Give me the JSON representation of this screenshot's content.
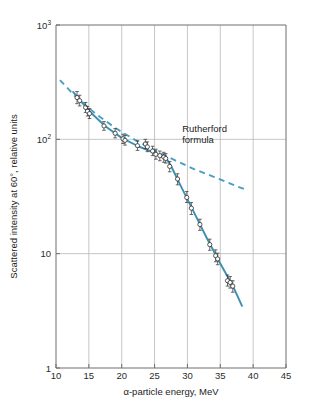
{
  "figure": {
    "background": "#ffffff",
    "curve_color": "#3d8fb0",
    "rutherford_color": "#4b9ec2",
    "grid_color": "#b8b8b8",
    "axis_color": "#6e6e6e",
    "marker_face": "#ffffff",
    "marker_edge": "#2f2f2f"
  },
  "chart_data": {
    "type": "scatter",
    "title": "",
    "xlabel": "α-particle energy, MeV",
    "ylabel": "Scattered intensity at 60°, relative units",
    "xlim": [
      10,
      45
    ],
    "ylim": [
      1,
      1000
    ],
    "yscale": "log",
    "xscale": "linear",
    "grid": true,
    "legend": "none",
    "xticks": [
      10,
      15,
      20,
      25,
      30,
      35,
      40,
      45
    ],
    "xticklabels": [
      "10",
      "15",
      "20",
      "25",
      "30",
      "35",
      "40",
      "45"
    ],
    "yticks": [
      1,
      10,
      100,
      1000
    ],
    "yticklabels": [
      "1",
      "10",
      "10²",
      "10³"
    ],
    "annotations": [
      {
        "text_line1": "Rutherford",
        "text_line2": "formula",
        "x": 29.2,
        "y": 115
      }
    ],
    "series": [
      {
        "name": "Measured scattered intensity",
        "type": "scatter",
        "marker": "open-circle",
        "errorbars": true,
        "points": [
          {
            "x": 13.2,
            "y": 232,
            "yerr_lo": 205,
            "yerr_hi": 262
          },
          {
            "x": 13.6,
            "y": 218,
            "yerr_lo": 196,
            "yerr_hi": 243
          },
          {
            "x": 14.5,
            "y": 190,
            "yerr_lo": 172,
            "yerr_hi": 210
          },
          {
            "x": 14.8,
            "y": 176,
            "yerr_lo": 160,
            "yerr_hi": 194
          },
          {
            "x": 15.1,
            "y": 168,
            "yerr_lo": 152,
            "yerr_hi": 186
          },
          {
            "x": 17.3,
            "y": 131,
            "yerr_lo": 120,
            "yerr_hi": 143
          },
          {
            "x": 19.0,
            "y": 113,
            "yerr_lo": 103,
            "yerr_hi": 124
          },
          {
            "x": 20.2,
            "y": 101,
            "yerr_lo": 92,
            "yerr_hi": 111
          },
          {
            "x": 20.5,
            "y": 98,
            "yerr_lo": 89,
            "yerr_hi": 108
          },
          {
            "x": 22.4,
            "y": 88,
            "yerr_lo": 80,
            "yerr_hi": 97
          },
          {
            "x": 23.6,
            "y": 91,
            "yerr_lo": 83,
            "yerr_hi": 100
          },
          {
            "x": 23.9,
            "y": 86,
            "yerr_lo": 78,
            "yerr_hi": 95
          },
          {
            "x": 24.7,
            "y": 79,
            "yerr_lo": 72,
            "yerr_hi": 87
          },
          {
            "x": 25.2,
            "y": 74,
            "yerr_lo": 67,
            "yerr_hi": 82
          },
          {
            "x": 25.8,
            "y": 72,
            "yerr_lo": 65,
            "yerr_hi": 79
          },
          {
            "x": 26.4,
            "y": 70,
            "yerr_lo": 63,
            "yerr_hi": 77
          },
          {
            "x": 26.7,
            "y": 68,
            "yerr_lo": 62,
            "yerr_hi": 75
          },
          {
            "x": 27.3,
            "y": 58,
            "yerr_lo": 52,
            "yerr_hi": 64
          },
          {
            "x": 28.5,
            "y": 45,
            "yerr_lo": 40,
            "yerr_hi": 50
          },
          {
            "x": 29.9,
            "y": 31,
            "yerr_lo": 28,
            "yerr_hi": 35
          },
          {
            "x": 30.6,
            "y": 25,
            "yerr_lo": 22,
            "yerr_hi": 28
          },
          {
            "x": 31.9,
            "y": 18,
            "yerr_lo": 16,
            "yerr_hi": 20
          },
          {
            "x": 33.4,
            "y": 12,
            "yerr_lo": 10.7,
            "yerr_hi": 13.4
          },
          {
            "x": 34.3,
            "y": 9.6,
            "yerr_lo": 8.5,
            "yerr_hi": 10.8
          },
          {
            "x": 34.6,
            "y": 9.0,
            "yerr_lo": 8.0,
            "yerr_hi": 10.1
          },
          {
            "x": 36.1,
            "y": 5.8,
            "yerr_lo": 5.2,
            "yerr_hi": 6.5
          },
          {
            "x": 36.5,
            "y": 5.6,
            "yerr_lo": 5.0,
            "yerr_hi": 6.3
          },
          {
            "x": 36.9,
            "y": 5.2,
            "yerr_lo": 4.6,
            "yerr_hi": 5.8
          }
        ]
      },
      {
        "name": "Fitted curve",
        "type": "line",
        "style": "solid",
        "points": [
          {
            "x": 12.6,
            "y": 260
          },
          {
            "x": 15.0,
            "y": 178
          },
          {
            "x": 17.5,
            "y": 130
          },
          {
            "x": 20.0,
            "y": 103
          },
          {
            "x": 22.5,
            "y": 87
          },
          {
            "x": 25.0,
            "y": 76
          },
          {
            "x": 26.8,
            "y": 68
          },
          {
            "x": 27.6,
            "y": 57
          },
          {
            "x": 29.0,
            "y": 39
          },
          {
            "x": 31.0,
            "y": 23
          },
          {
            "x": 33.0,
            "y": 13.5
          },
          {
            "x": 35.0,
            "y": 8.2
          },
          {
            "x": 37.0,
            "y": 5.1
          },
          {
            "x": 38.3,
            "y": 3.5
          }
        ]
      },
      {
        "name": "Rutherford formula",
        "type": "line",
        "style": "dashed",
        "points": [
          {
            "x": 10.6,
            "y": 330
          },
          {
            "x": 13.0,
            "y": 235
          },
          {
            "x": 16.0,
            "y": 168
          },
          {
            "x": 19.0,
            "y": 126
          },
          {
            "x": 22.0,
            "y": 99
          },
          {
            "x": 25.0,
            "y": 80
          },
          {
            "x": 28.0,
            "y": 66
          },
          {
            "x": 31.0,
            "y": 55
          },
          {
            "x": 34.0,
            "y": 47
          },
          {
            "x": 37.0,
            "y": 40
          },
          {
            "x": 39.0,
            "y": 36
          }
        ]
      }
    ]
  }
}
